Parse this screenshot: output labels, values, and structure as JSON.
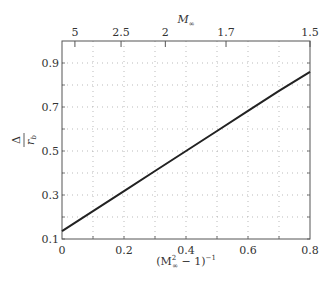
{
  "chart_data": {
    "type": "line",
    "title": "",
    "xlabel": "(M∞² − 1)⁻¹",
    "xlabel_parts": {
      "open": "(M",
      "sup": "2",
      "sub": "∞",
      "mid": " − 1)",
      "exp": "−1"
    },
    "ylabel": "Δ / r_b",
    "ylabel_parts": {
      "num": "Δ",
      "den": "r",
      "den_sub": "b"
    },
    "top_xlabel": "M∞",
    "top_xlabel_parts": {
      "main": "M",
      "sub": "∞"
    },
    "xlim": [
      0,
      0.8
    ],
    "ylim": [
      0.1,
      1.0
    ],
    "x_ticks": [
      0,
      0.2,
      0.4,
      0.6,
      0.8
    ],
    "x_tick_labels": [
      "0",
      "0.2",
      "0.4",
      "0.6",
      "0.8"
    ],
    "y_ticks": [
      0.1,
      0.3,
      0.5,
      0.7,
      0.9
    ],
    "y_tick_labels": [
      "0.1",
      "0.3",
      "0.5",
      "0.7",
      "0.9"
    ],
    "x_grid": [
      0.1,
      0.2,
      0.3,
      0.4,
      0.5,
      0.6,
      0.7
    ],
    "y_grid": [
      0.2,
      0.3,
      0.4,
      0.5,
      0.6,
      0.7,
      0.8,
      0.9
    ],
    "top_axis": {
      "label": "M∞",
      "ticks": [
        5,
        2.5,
        2,
        1.7,
        1.5
      ],
      "tick_labels": [
        "5",
        "2.5",
        "2",
        "1.7",
        "1.5"
      ],
      "mapping": "x = 1/(M∞² − 1)"
    },
    "grid": true,
    "grid_style": "dotted",
    "legend": null,
    "series": [
      {
        "name": "Δ/r_b",
        "color": "#222222",
        "x": [
          0,
          0.1,
          0.2,
          0.3,
          0.4,
          0.5,
          0.6,
          0.7,
          0.8
        ],
        "y": [
          0.136,
          0.227,
          0.318,
          0.409,
          0.5,
          0.591,
          0.682,
          0.773,
          0.86
        ]
      }
    ]
  },
  "colors": {
    "frame": "#555555",
    "grid": "#aaaaaa",
    "line": "#222222",
    "text": "#333333"
  }
}
